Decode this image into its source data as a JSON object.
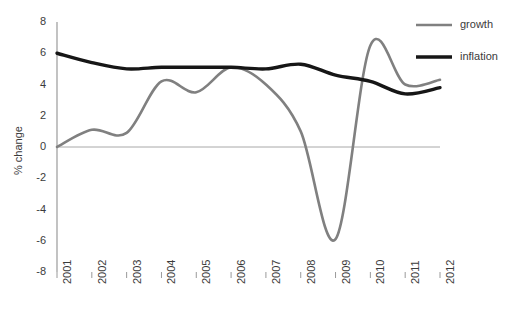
{
  "chart_data": {
    "type": "line",
    "title": "",
    "xlabel": "",
    "ylabel": "% change",
    "x": [
      2001,
      2002,
      2003,
      2004,
      2005,
      2006,
      2007,
      2008,
      2009,
      2010,
      2011,
      2012
    ],
    "categories": [
      "2001",
      "2002",
      "2003",
      "2004",
      "2005",
      "2006",
      "2007",
      "2008",
      "2009",
      "2010",
      "2011",
      "2012"
    ],
    "xlim": [
      2001,
      2012
    ],
    "ylim": [
      -8,
      8
    ],
    "yticks": [
      8,
      6,
      4,
      2,
      0,
      -2,
      -4,
      -6,
      -8
    ],
    "ytick_labels": [
      "8",
      "6",
      "4",
      "2",
      "0",
      "-2",
      "-4",
      "-6",
      "-8"
    ],
    "grid": false,
    "zero_line": true,
    "legend_position": "top-right",
    "series": [
      {
        "name": "growth",
        "color": "#808080",
        "width": 2.6,
        "values": [
          0.0,
          1.1,
          0.9,
          4.2,
          3.5,
          5.1,
          4.0,
          1.0,
          -5.9,
          6.5,
          4.0,
          4.3
        ]
      },
      {
        "name": "inflation",
        "color": "#161616",
        "width": 3.4,
        "values": [
          6.0,
          5.4,
          5.0,
          5.1,
          5.1,
          5.1,
          5.0,
          5.3,
          4.6,
          4.2,
          3.4,
          3.8
        ]
      }
    ]
  },
  "legend": {
    "items": [
      {
        "label": "growth",
        "color": "#808080"
      },
      {
        "label": "inflation",
        "color": "#161616"
      }
    ]
  },
  "axes": {
    "y_title": "% change",
    "axis_color": "#9a9a9a",
    "zero_line_color": "#a8a8a8"
  }
}
